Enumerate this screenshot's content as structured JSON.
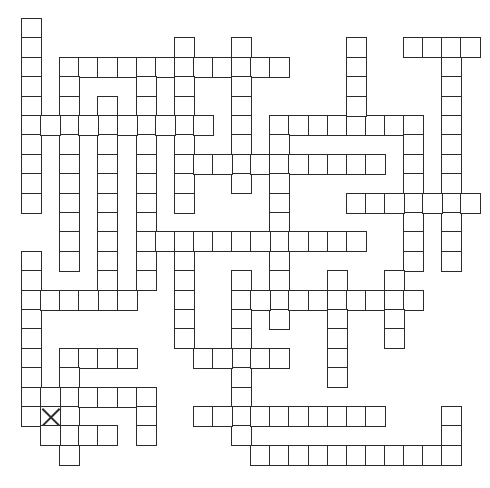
{
  "puzzle": {
    "type": "crossword-grid",
    "grid": {
      "origin_x": 21,
      "origin_y": 18,
      "cell_w": 19.1,
      "cell_h": 19.4,
      "border_color": "#2b2b2b",
      "fill_color": "#ffffff"
    },
    "words": [
      {
        "dir": "down",
        "col": 0,
        "row": 0,
        "len": 10
      },
      {
        "dir": "across",
        "col": 2,
        "row": 2,
        "len": 12
      },
      {
        "dir": "down",
        "col": 2,
        "row": 2,
        "len": 11
      },
      {
        "dir": "down",
        "col": 4,
        "row": 4,
        "len": 11
      },
      {
        "dir": "down",
        "col": 6,
        "row": 2,
        "len": 12
      },
      {
        "dir": "down",
        "col": 8,
        "row": 1,
        "len": 9
      },
      {
        "dir": "down",
        "col": 11,
        "row": 1,
        "len": 8
      },
      {
        "dir": "across",
        "col": 0,
        "row": 5,
        "len": 10
      },
      {
        "dir": "across",
        "col": 8,
        "row": 7,
        "len": 11
      },
      {
        "dir": "across",
        "col": 13,
        "row": 5,
        "len": 8
      },
      {
        "dir": "down",
        "col": 13,
        "row": 5,
        "len": 11
      },
      {
        "dir": "down",
        "col": 17,
        "row": 1,
        "len": 5
      },
      {
        "dir": "across",
        "col": 20,
        "row": 1,
        "len": 4
      },
      {
        "dir": "down",
        "col": 22,
        "row": 1,
        "len": 12
      },
      {
        "dir": "down",
        "col": 20,
        "row": 5,
        "len": 8
      },
      {
        "dir": "across",
        "col": 17,
        "row": 9,
        "len": 7
      },
      {
        "dir": "across",
        "col": 6,
        "row": 11,
        "len": 12
      },
      {
        "dir": "down",
        "col": 0,
        "row": 12,
        "len": 9
      },
      {
        "dir": "across",
        "col": 0,
        "row": 14,
        "len": 6
      },
      {
        "dir": "down",
        "col": 8,
        "row": 11,
        "len": 6
      },
      {
        "dir": "across",
        "col": 11,
        "row": 14,
        "len": 10
      },
      {
        "dir": "down",
        "col": 11,
        "row": 13,
        "len": 9
      },
      {
        "dir": "down",
        "col": 16,
        "row": 13,
        "len": 6
      },
      {
        "dir": "down",
        "col": 19,
        "row": 13,
        "len": 4
      },
      {
        "dir": "across",
        "col": 9,
        "row": 17,
        "len": 5
      },
      {
        "dir": "across",
        "col": 2,
        "row": 17,
        "len": 4
      },
      {
        "dir": "down",
        "col": 2,
        "row": 17,
        "len": 6
      },
      {
        "dir": "across",
        "col": 0,
        "row": 19,
        "len": 7
      },
      {
        "dir": "down",
        "col": 6,
        "row": 19,
        "len": 3
      },
      {
        "dir": "across",
        "col": 0,
        "row": 20,
        "len": 3
      },
      {
        "dir": "across",
        "col": 1,
        "row": 21,
        "len": 4
      },
      {
        "dir": "across",
        "col": 9,
        "row": 20,
        "len": 10
      },
      {
        "dir": "across",
        "col": 12,
        "row": 22,
        "len": 11
      },
      {
        "dir": "down",
        "col": 22,
        "row": 20,
        "len": 3
      }
    ],
    "marked_cells": [
      {
        "col": 1,
        "row": 20,
        "mark": "x-icon"
      }
    ]
  }
}
